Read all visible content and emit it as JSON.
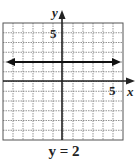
{
  "chart_data": {
    "type": "line",
    "title": "y = 2",
    "xlabel": "x",
    "ylabel": "y",
    "xlim": [
      -6,
      6
    ],
    "ylim": [
      -6,
      6
    ],
    "grid": true,
    "tick_labels": {
      "x": [
        "5"
      ],
      "y": [
        "5"
      ]
    },
    "series": [
      {
        "name": "y = 2",
        "x": [
          -5.5,
          5.5
        ],
        "y": [
          2,
          2
        ],
        "arrows": "both"
      }
    ]
  },
  "labels": {
    "x_axis": "x",
    "y_axis": "y",
    "x_tick": "5",
    "y_tick": "5",
    "caption": "y = 2"
  },
  "colors": {
    "grid": "#555555",
    "axis": "#222222",
    "line": "#111111"
  }
}
